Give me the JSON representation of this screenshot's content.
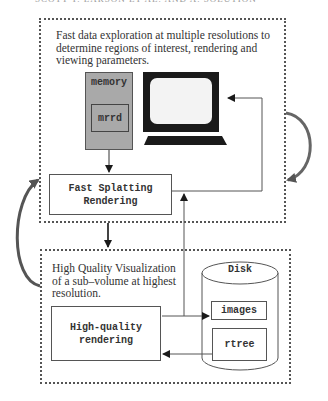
{
  "header": {
    "running_head": "SCOTT T. LARSON ET AL. AND A. SOLUTION"
  },
  "top_section": {
    "description": "Fast data exploration at multiple resolutions to determine regions of interest, rendering and viewing parameters.",
    "memory_label": "memory",
    "mrrd_label": "mrrd",
    "monitor_icon": "computer-monitor-icon",
    "fast_splatting_label_line1": "Fast Splatting",
    "fast_splatting_label_line2": "Rendering"
  },
  "bottom_section": {
    "description": "High Quality Visualization of a sub–volume at highest resolution.",
    "hq_render_line1": "High-quality",
    "hq_render_line2": "rendering",
    "disk_label": "Disk",
    "images_label": "images",
    "rtree_label": "rtree"
  },
  "colors": {
    "memory_fill": "#a9a9a9",
    "line": "#555555",
    "loop_arrow": "#666666",
    "monitor": "#1a1a1a"
  }
}
